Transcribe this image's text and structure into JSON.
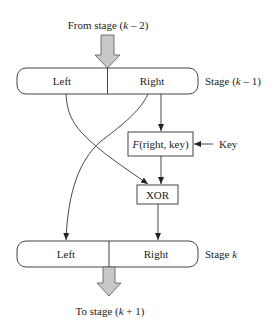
{
  "diagram": {
    "top_input": {
      "prefix": "From stage (",
      "var": "k",
      "suffix": " – 2)"
    },
    "bottom_output": {
      "prefix": "To stage (",
      "var": "k",
      "suffix": " + 1)"
    },
    "stage_prev": {
      "left": "Left",
      "right": "Right",
      "label_prefix": "Stage (",
      "label_var": "k",
      "label_suffix": " – 1)"
    },
    "stage_curr": {
      "left": "Left",
      "right": "Right",
      "label_prefix": "Stage ",
      "label_var": "k",
      "label_suffix": ""
    },
    "function_box": {
      "fn": "F",
      "args": "(right, key)"
    },
    "xor_box": {
      "label": "XOR"
    },
    "key_input": {
      "label": "Key"
    },
    "colors": {
      "line": "#333333",
      "fat_arrow_fill": "#c8c8c8",
      "fat_arrow_stroke": "#555555",
      "box_stroke": "#444444"
    }
  }
}
